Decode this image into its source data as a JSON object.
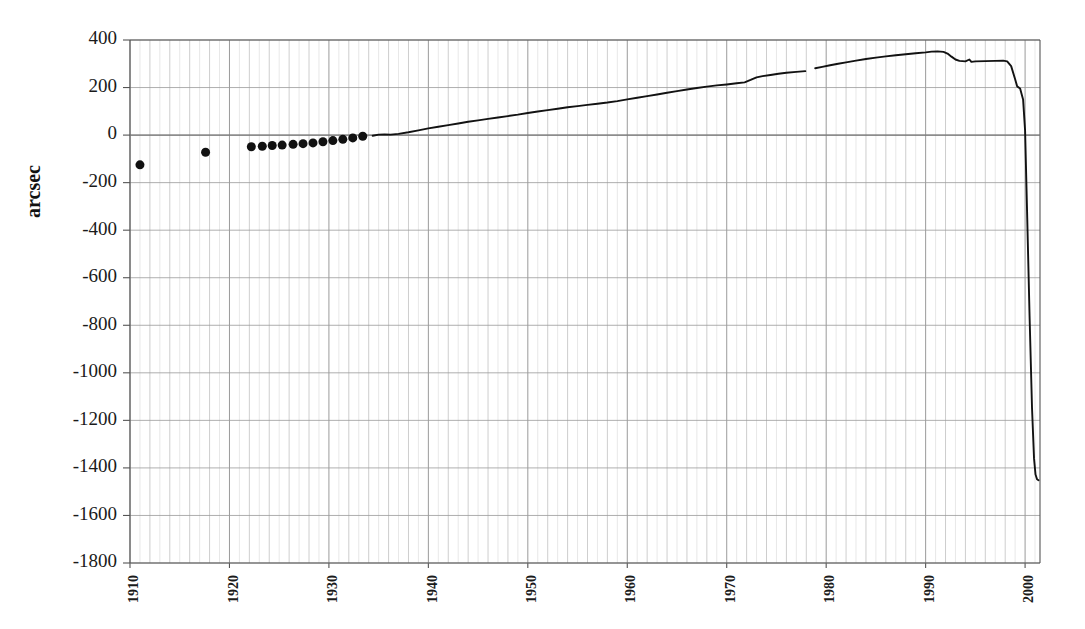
{
  "chart_data": {
    "type": "scatter",
    "title": "",
    "xlabel": "",
    "ylabel": "arcsec",
    "xlim": [
      1910,
      2001.5
    ],
    "ylim": [
      -1800,
      400
    ],
    "grid": true,
    "legend": "none",
    "x_tick_labels": [
      "1910",
      "1920",
      "1930",
      "1940",
      "1950",
      "1960",
      "1970",
      "1980",
      "1990",
      "2000"
    ],
    "x_tick_values": [
      1910,
      1920,
      1930,
      1940,
      1950,
      1960,
      1970,
      1980,
      1990,
      2000
    ],
    "x_minor_tick_interval": 1,
    "y_tick_labels": [
      "400",
      "200",
      "0",
      "-200",
      "-400",
      "-600",
      "-800",
      "-1000",
      "-1200",
      "-1400",
      "-1600",
      "-1800"
    ],
    "y_tick_values": [
      400,
      200,
      0,
      -200,
      -400,
      -600,
      -800,
      -1000,
      -1200,
      -1400,
      -1600,
      -1800
    ],
    "series": [
      {
        "name": "early-observations",
        "render": "markers",
        "marker": "filled-circle",
        "marker_size": 9,
        "color": "#111111",
        "points": [
          [
            1911.0,
            -125
          ],
          [
            1917.6,
            -72
          ],
          [
            1922.2,
            -49
          ],
          [
            1923.3,
            -47
          ],
          [
            1924.3,
            -44
          ],
          [
            1925.3,
            -42
          ],
          [
            1926.4,
            -39
          ],
          [
            1927.4,
            -36
          ],
          [
            1928.4,
            -33
          ],
          [
            1929.4,
            -28
          ],
          [
            1930.4,
            -23
          ],
          [
            1931.4,
            -18
          ],
          [
            1932.4,
            -12
          ],
          [
            1933.4,
            -5
          ]
        ]
      },
      {
        "name": "continuous-record-segment-1",
        "render": "line",
        "color": "#121212",
        "points": [
          [
            1934.4,
            -3
          ],
          [
            1935.0,
            2
          ],
          [
            1935.6,
            3
          ],
          [
            1936.2,
            2
          ],
          [
            1937.0,
            5
          ],
          [
            1938.0,
            12
          ],
          [
            1939.0,
            20
          ],
          [
            1940.0,
            28
          ],
          [
            1941.0,
            35
          ],
          [
            1942.0,
            42
          ],
          [
            1943.0,
            49
          ],
          [
            1944.0,
            56
          ],
          [
            1945.0,
            62
          ],
          [
            1946.0,
            68
          ],
          [
            1947.0,
            74
          ],
          [
            1948.0,
            80
          ],
          [
            1949.0,
            86
          ],
          [
            1950.0,
            93
          ],
          [
            1951.0,
            99
          ],
          [
            1952.0,
            105
          ],
          [
            1953.0,
            111
          ],
          [
            1954.0,
            117
          ],
          [
            1955.0,
            122
          ],
          [
            1956.0,
            127
          ],
          [
            1957.0,
            132
          ],
          [
            1958.0,
            137
          ],
          [
            1959.0,
            143
          ],
          [
            1960.0,
            150
          ],
          [
            1961.0,
            157
          ],
          [
            1962.0,
            164
          ],
          [
            1963.0,
            171
          ],
          [
            1964.0,
            178
          ],
          [
            1965.0,
            185
          ],
          [
            1966.0,
            192
          ],
          [
            1967.0,
            198
          ],
          [
            1968.0,
            204
          ],
          [
            1969.0,
            209
          ],
          [
            1970.0,
            213
          ],
          [
            1971.0,
            218
          ],
          [
            1971.8,
            222
          ],
          [
            1972.4,
            232
          ],
          [
            1973.0,
            243
          ],
          [
            1973.6,
            248
          ],
          [
            1974.4,
            253
          ],
          [
            1975.2,
            258
          ],
          [
            1976.0,
            262
          ],
          [
            1977.0,
            266
          ],
          [
            1977.9,
            269
          ]
        ]
      },
      {
        "name": "continuous-record-segment-2",
        "render": "line",
        "color": "#121212",
        "points": [
          [
            1978.9,
            281
          ],
          [
            1979.6,
            287
          ],
          [
            1980.4,
            294
          ],
          [
            1981.2,
            300
          ],
          [
            1982.0,
            306
          ],
          [
            1983.0,
            313
          ],
          [
            1984.0,
            320
          ],
          [
            1985.0,
            326
          ],
          [
            1986.0,
            331
          ],
          [
            1987.0,
            336
          ],
          [
            1988.0,
            340
          ],
          [
            1989.0,
            344
          ],
          [
            1990.0,
            348
          ],
          [
            1990.6,
            351
          ],
          [
            1991.2,
            352
          ],
          [
            1991.8,
            350
          ],
          [
            1992.2,
            343
          ],
          [
            1992.6,
            330
          ],
          [
            1993.0,
            318
          ],
          [
            1993.4,
            312
          ],
          [
            1994.0,
            310
          ],
          [
            1994.4,
            318
          ],
          [
            1994.6,
            308
          ],
          [
            1995.0,
            310
          ],
          [
            1996.0,
            311
          ],
          [
            1997.0,
            312
          ],
          [
            1997.8,
            313
          ],
          [
            1998.2,
            310
          ],
          [
            1998.6,
            290
          ],
          [
            1999.0,
            235
          ],
          [
            1999.2,
            205
          ],
          [
            1999.5,
            196
          ],
          [
            1999.8,
            150
          ],
          [
            2000.0,
            20
          ],
          [
            2000.2,
            -320
          ],
          [
            2000.45,
            -760
          ],
          [
            2000.7,
            -1150
          ],
          [
            2000.9,
            -1360
          ],
          [
            2001.05,
            -1428
          ],
          [
            2001.2,
            -1448
          ],
          [
            2001.35,
            -1452
          ]
        ]
      }
    ]
  },
  "plot_area": {
    "left": 130,
    "top": 40,
    "right": 1040,
    "bottom": 563
  }
}
